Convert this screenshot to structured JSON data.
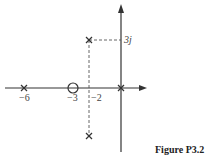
{
  "figure": {
    "caption": "Figure P3.2",
    "type": "pole-zero plot (s-plane)",
    "axes": {
      "real_axis_arrow": "right",
      "imag_axis_arrow": "up"
    },
    "real_tick_labels": [
      "−6",
      "−3",
      "−2"
    ],
    "imag_tick_labels": [
      "3j"
    ],
    "poles": [
      {
        "re": -6,
        "im": 0
      },
      {
        "re": 0,
        "im": 0
      },
      {
        "re": -2,
        "im": 3
      },
      {
        "re": -2,
        "im": -3
      }
    ],
    "zeros": [
      {
        "re": -3,
        "im": 0
      }
    ],
    "guides": [
      {
        "from": "(-2,3j)",
        "to": "(0,3j)",
        "style": "dashed"
      },
      {
        "from": "(-2,3j)",
        "to": "(-2,-3j)",
        "style": "dashed"
      }
    ],
    "colors": {
      "ink": "#333333",
      "background": "#ffffff"
    }
  }
}
